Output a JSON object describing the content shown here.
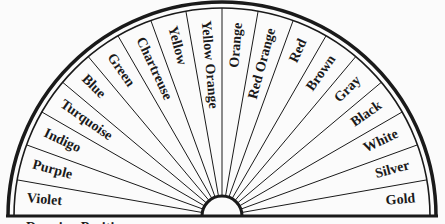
{
  "chart": {
    "center": {
      "x": 222,
      "y": 216
    },
    "outer_radius": 214,
    "inner_radius": 20,
    "segments": [
      {
        "label": "Violet"
      },
      {
        "label": "Purple"
      },
      {
        "label": "Indigo"
      },
      {
        "label": "Turquoise"
      },
      {
        "label": "Blue"
      },
      {
        "label": "Green"
      },
      {
        "label": "Chartreuse"
      },
      {
        "label": "Yellow"
      },
      {
        "label": "Yellow Orange"
      },
      {
        "label": "Orange"
      },
      {
        "label": "Red Orange"
      },
      {
        "label": "Red"
      },
      {
        "label": "Brown"
      },
      {
        "label": "Gray"
      },
      {
        "label": "Black"
      },
      {
        "label": "White"
      },
      {
        "label": "Silver"
      },
      {
        "label": "Gold"
      }
    ],
    "caption": "Dowsing Position",
    "colors": {
      "line": "#1a1a1a",
      "background": "#fbfbfb"
    }
  }
}
